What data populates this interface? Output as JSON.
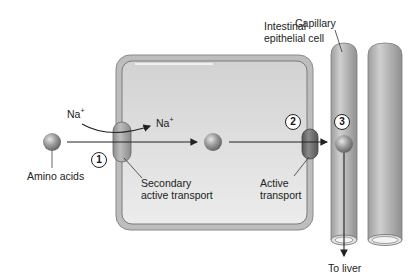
{
  "diagram": {
    "title_labels": {
      "cell": [
        "Intestinal",
        "epithelial cell"
      ],
      "capillary": "Capillary"
    },
    "ions": {
      "na_outside": "Na",
      "na_inside": "Na",
      "charge": "+"
    },
    "molecules": {
      "amino_acids": "Amino acids"
    },
    "transporters": {
      "secondary": [
        "Secondary",
        "active transport"
      ],
      "active": [
        "Active",
        "transport"
      ]
    },
    "steps": [
      "1",
      "2",
      "3"
    ],
    "destination": "To liver",
    "colors": {
      "cell_fill": "#d9d9d9",
      "cell_border": "#9a9a9a",
      "capillary": "#b8b8b8",
      "ball": "#8c8c8c",
      "secondary_transporter": "#a6a6a6",
      "active_transporter": "#6e6e6e",
      "arrow": "#222222"
    }
  }
}
